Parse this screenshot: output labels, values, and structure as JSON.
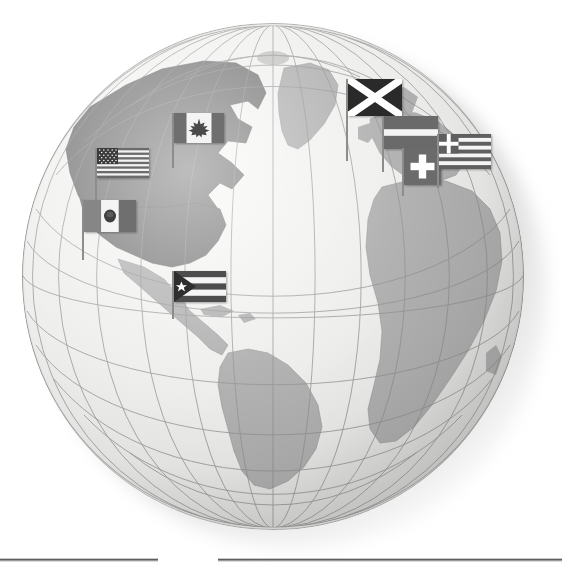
{
  "scene": {
    "title": "World globe with national flags",
    "background_color": "#ffffff",
    "ocean_color": "#ededeb",
    "land_color": "#a9a9a9",
    "land_dark_color": "#6e6e6e",
    "graticule_color": "#8a8a8a",
    "pole_color": "#8d8d8d"
  },
  "globe": {
    "label": "globe",
    "center_x": 273,
    "center_y": 276,
    "radius": 251,
    "projection": "orthographic",
    "graticule_spacing_degrees": 15,
    "center_longitude": -30,
    "center_latitude": 20,
    "visible_regions": [
      "North America",
      "Greenland",
      "Central America",
      "Caribbean",
      "South America",
      "Europe",
      "Africa",
      "Arctic"
    ]
  },
  "flags": [
    {
      "id": "flag-united-states",
      "name": "United States",
      "x": 95,
      "y": 148,
      "width": 52,
      "height": 30,
      "pole_height": 62,
      "colors": {
        "stripe_dark": "#6b6b6b",
        "stripe_light": "#f2f2f2",
        "canton": "#3b3b3b",
        "star": "#ffffff"
      },
      "design": "13 horizontal stripes with star-field canton"
    },
    {
      "id": "flag-canada",
      "name": "Canada",
      "x": 172,
      "y": 113,
      "width": 50,
      "height": 30,
      "pole_height": 55,
      "colors": {
        "band": "#6f6f6f",
        "field": "#f4f4f4",
        "emblem": "#4a4a4a"
      },
      "design": "vertical band–field–band with maple leaf"
    },
    {
      "id": "flag-mexico",
      "name": "Mexico",
      "x": 82,
      "y": 200,
      "width": 52,
      "height": 32,
      "pole_height": 60,
      "colors": {
        "band_left": "#868686",
        "field": "#f4f4f4",
        "band_right": "#6f6f6f",
        "emblem": "#3f3f3f"
      },
      "design": "vertical tricolour with central coat of arms"
    },
    {
      "id": "flag-puerto-rico",
      "name": "Puerto Rico",
      "x": 172,
      "y": 271,
      "width": 52,
      "height": 31,
      "pole_height": 48,
      "colors": {
        "stripe_dark": "#4d4d4d",
        "stripe_light": "#f5f5f5",
        "triangle": "#2e2e2e",
        "star": "#ffffff"
      },
      "design": "five stripes with hoist triangle and single star"
    },
    {
      "id": "flag-scotland",
      "name": "Scotland",
      "x": 346,
      "y": 79,
      "width": 54,
      "height": 37,
      "pole_height": 82,
      "colors": {
        "field": "#2a2a2a",
        "saltire": "#ffffff"
      },
      "design": "white saltire on dark field"
    },
    {
      "id": "flag-latvia",
      "name": "Latvia",
      "x": 382,
      "y": 116,
      "width": 54,
      "height": 33,
      "pole_height": 56,
      "colors": {
        "band": "#6a6a6a",
        "centre": "#f4f4f4"
      },
      "design": "dark–white–dark horizontal bands"
    },
    {
      "id": "flag-switzerland",
      "name": "Switzerland",
      "x": 402,
      "y": 148,
      "width": 37,
      "height": 37,
      "pole_height": 48,
      "colors": {
        "field": "#6b6b6b",
        "cross": "#ffffff"
      },
      "design": "square flag with centred white cross"
    },
    {
      "id": "flag-greece",
      "name": "Greece",
      "x": 437,
      "y": 134,
      "width": 52,
      "height": 35,
      "pole_height": 54,
      "colors": {
        "stripe_dark": "#5f5f5f",
        "stripe_light": "#f4f4f4",
        "canton": "#5f5f5f",
        "cross": "#ffffff"
      },
      "design": "nine stripes with cross in canton"
    }
  ],
  "rules": [
    {
      "id": "rule-left",
      "x": 0,
      "y": 558,
      "width": 158
    },
    {
      "id": "rule-right",
      "x": 218,
      "y": 558,
      "width": 344
    }
  ]
}
